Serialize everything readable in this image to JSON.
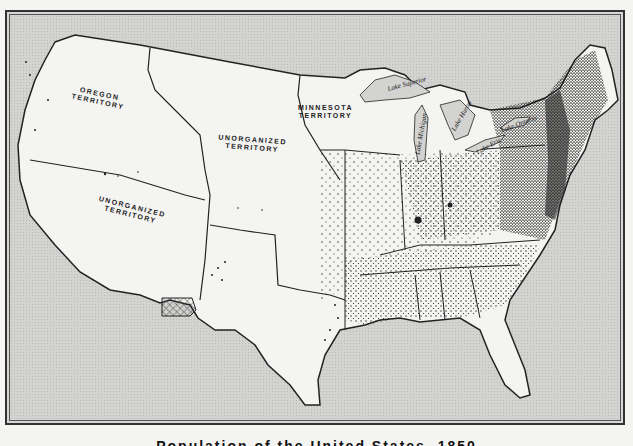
{
  "map": {
    "caption": "Population of the United States, 1850",
    "caption_visible_fragment": "1850",
    "colors": {
      "water": "#d3d3d1",
      "land": "#f4f4f2",
      "border": "#222222",
      "dots": "#111111",
      "hatched_area": "#777777"
    },
    "territory_labels": [
      {
        "id": "oregon",
        "line1": "OREGON",
        "line2": "TERRITORY"
      },
      {
        "id": "unorganized-north",
        "line1": "UNORGANIZED",
        "line2": "TERRITORY"
      },
      {
        "id": "minnesota",
        "line1": "MINNESOTA",
        "line2": "TERRITORY"
      },
      {
        "id": "unorganized-west",
        "line1": "UNORGANIZED",
        "line2": "TERRITORY"
      }
    ],
    "lake_labels": [
      {
        "id": "superior",
        "text": "Lake Superior"
      },
      {
        "id": "michigan",
        "text": "Lake Michigan"
      },
      {
        "id": "huron",
        "text": "Lake Huron"
      },
      {
        "id": "erie",
        "text": "Lake Erie"
      },
      {
        "id": "ontario",
        "text": "Lake Ontario"
      }
    ],
    "legend": "Each dot represents population"
  }
}
